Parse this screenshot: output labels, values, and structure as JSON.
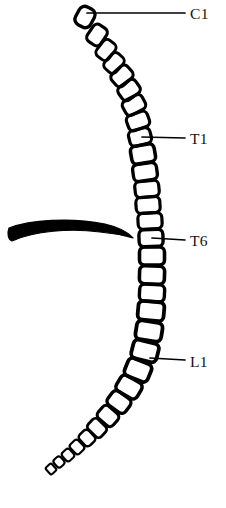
{
  "figure": {
    "background_color": "#ffffff",
    "ink_color": "#000000",
    "width": 226,
    "height": 508
  },
  "labels": [
    {
      "id": "c1",
      "text": "C1",
      "text_x": 190,
      "text_y": 19,
      "leader_x1": 87,
      "leader_y1": 13,
      "leader_x2": 185,
      "leader_y2": 13
    },
    {
      "id": "t1",
      "text": "T1",
      "text_x": 190,
      "text_y": 144,
      "leader_x1": 142,
      "leader_y1": 137,
      "leader_x2": 185,
      "leader_y2": 138
    },
    {
      "id": "t6",
      "text": "T6",
      "text_x": 190,
      "text_y": 246,
      "leader_x1": 152,
      "leader_y1": 238,
      "leader_x2": 185,
      "leader_y2": 240
    },
    {
      "id": "l1",
      "text": "L1",
      "text_x": 190,
      "text_y": 367,
      "leader_x1": 150,
      "leader_y1": 358,
      "leader_x2": 185,
      "leader_y2": 360
    }
  ],
  "rib": {
    "name": "rib-shadow",
    "path": "M 9 228 C 30 220 70 217 105 224 C 118 227 128 232 133 238 C 126 236 112 233 100 232 C 70 228 34 231 12 241 C 8 240 7 233 9 228 Z"
  },
  "vertebrae": [
    {
      "n": 1,
      "cx": 85,
      "cy": 17,
      "w": 20,
      "h": 17,
      "rot": -62,
      "r": 6
    },
    {
      "n": 2,
      "cx": 97,
      "cy": 35,
      "w": 20,
      "h": 16,
      "rot": -56,
      "r": 5
    },
    {
      "n": 3,
      "cx": 106,
      "cy": 50,
      "w": 20,
      "h": 15,
      "rot": -52,
      "r": 5
    },
    {
      "n": 4,
      "cx": 114,
      "cy": 63,
      "w": 20,
      "h": 15,
      "rot": -48,
      "r": 5
    },
    {
      "n": 5,
      "cx": 122,
      "cy": 76,
      "w": 21,
      "h": 16,
      "rot": -42,
      "r": 5
    },
    {
      "n": 6,
      "cx": 129,
      "cy": 90,
      "w": 21,
      "h": 16,
      "rot": -36,
      "r": 5
    },
    {
      "n": 7,
      "cx": 134,
      "cy": 105,
      "w": 22,
      "h": 16,
      "rot": -28,
      "r": 5
    },
    {
      "n": 8,
      "cx": 138,
      "cy": 121,
      "w": 22,
      "h": 16,
      "rot": -20,
      "r": 5
    },
    {
      "n": 9,
      "cx": 140,
      "cy": 137,
      "w": 22,
      "h": 16,
      "rot": -14,
      "r": 5
    },
    {
      "n": 10,
      "cx": 143,
      "cy": 154,
      "w": 24,
      "h": 18,
      "rot": -10,
      "r": 5
    },
    {
      "n": 11,
      "cx": 145,
      "cy": 172,
      "w": 24,
      "h": 17,
      "rot": -8,
      "r": 5
    },
    {
      "n": 12,
      "cx": 147,
      "cy": 189,
      "w": 24,
      "h": 16,
      "rot": -6,
      "r": 5
    },
    {
      "n": 13,
      "cx": 148,
      "cy": 205,
      "w": 24,
      "h": 16,
      "rot": -4,
      "r": 5
    },
    {
      "n": 14,
      "cx": 150,
      "cy": 221,
      "w": 24,
      "h": 16,
      "rot": -3,
      "r": 5
    },
    {
      "n": 15,
      "cx": 151,
      "cy": 238,
      "w": 24,
      "h": 17,
      "rot": -2,
      "r": 5
    },
    {
      "n": 16,
      "cx": 152,
      "cy": 256,
      "w": 25,
      "h": 18,
      "rot": 0,
      "r": 5
    },
    {
      "n": 17,
      "cx": 152,
      "cy": 275,
      "w": 25,
      "h": 18,
      "rot": 2,
      "r": 5
    },
    {
      "n": 18,
      "cx": 152,
      "cy": 293,
      "w": 25,
      "h": 17,
      "rot": 3,
      "r": 5
    },
    {
      "n": 19,
      "cx": 151,
      "cy": 311,
      "w": 26,
      "h": 19,
      "rot": 5,
      "r": 5
    },
    {
      "n": 20,
      "cx": 149,
      "cy": 331,
      "w": 26,
      "h": 19,
      "rot": 9,
      "r": 5
    },
    {
      "n": 21,
      "cx": 145,
      "cy": 351,
      "w": 26,
      "h": 19,
      "rot": 14,
      "r": 5
    },
    {
      "n": 22,
      "cx": 138,
      "cy": 370,
      "w": 25,
      "h": 19,
      "rot": 22,
      "r": 5
    },
    {
      "n": 23,
      "cx": 129,
      "cy": 387,
      "w": 24,
      "h": 18,
      "rot": 30,
      "r": 5
    },
    {
      "n": 24,
      "cx": 119,
      "cy": 402,
      "w": 22,
      "h": 17,
      "rot": 36,
      "r": 5
    },
    {
      "n": 25,
      "cx": 108,
      "cy": 416,
      "w": 20,
      "h": 16,
      "rot": 41,
      "r": 5
    },
    {
      "n": 26,
      "cx": 97,
      "cy": 428,
      "w": 18,
      "h": 14,
      "rot": 44,
      "r": 4
    },
    {
      "n": 27,
      "cx": 87,
      "cy": 438,
      "w": 15,
      "h": 13,
      "rot": 46,
      "r": 4
    },
    {
      "n": 28,
      "cx": 77,
      "cy": 447,
      "w": 13,
      "h": 11,
      "rot": 47,
      "r": 3
    },
    {
      "n": 29,
      "cx": 68,
      "cy": 455,
      "w": 11,
      "h": 10,
      "rot": 48,
      "r": 3
    },
    {
      "n": 30,
      "cx": 59,
      "cy": 462,
      "w": 10,
      "h": 9,
      "rot": 48,
      "r": 3
    },
    {
      "n": 31,
      "cx": 51,
      "cy": 469,
      "w": 9,
      "h": 8,
      "rot": 48,
      "r": 2
    }
  ]
}
